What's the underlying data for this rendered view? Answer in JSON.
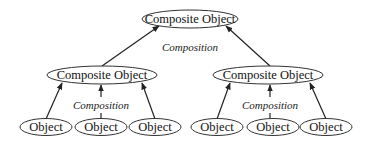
{
  "diagram": {
    "type": "tree",
    "root": {
      "label": "Composite Object"
    },
    "root_relation_label": "Composition",
    "children": [
      {
        "label": "Composite Object",
        "relation_label": "Composition",
        "children": [
          {
            "label": "Object"
          },
          {
            "label": "Object"
          },
          {
            "label": "Object"
          }
        ]
      },
      {
        "label": "Composite Object",
        "relation_label": "Composition",
        "children": [
          {
            "label": "Object"
          },
          {
            "label": "Object"
          },
          {
            "label": "Object"
          }
        ]
      }
    ],
    "colors": {
      "stroke": "#333333",
      "text": "#111111",
      "background": "#ffffff"
    }
  }
}
